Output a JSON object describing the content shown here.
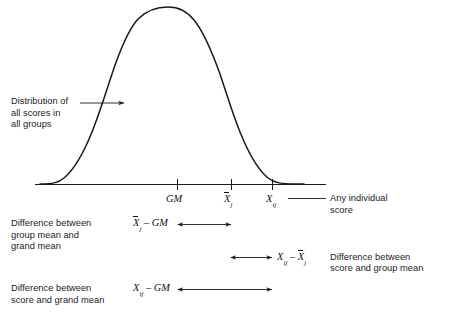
{
  "figure": {
    "type": "annotated-normal-distribution-diagram",
    "title_visible": false,
    "background_color": "#ffffff",
    "line_color": "#1a1a1a",
    "text_color": "#1c1c1c"
  },
  "curve": {
    "name": "normal-distribution-curve",
    "peak_x": 176,
    "peak_y": 12,
    "baseline_y": 184,
    "left_tail_x": 50,
    "right_tail_x": 300
  },
  "axis": {
    "name": "baseline-axis",
    "x_start": 35,
    "x_end": 326,
    "y": 184,
    "ticks": [
      {
        "label": "GM",
        "x": 177,
        "type": "plain"
      },
      {
        "label": "X̄j",
        "x": 231,
        "type": "overbar-sub"
      },
      {
        "label": "Xij",
        "x": 272,
        "type": "sub-only"
      }
    ]
  },
  "tick_labels": {
    "grand_mean": "GM",
    "group_mean_base": "X",
    "group_mean_sub": "j",
    "score_base": "X",
    "score_sub": "ij"
  },
  "callouts": {
    "distribution": {
      "lines": [
        "Distribution of",
        "all scores in",
        "all groups"
      ],
      "arrow_from_x": 80,
      "arrow_to_x": 126,
      "arrow_y": 103
    },
    "individual_score": {
      "lines": [
        "Any individual",
        "score"
      ],
      "leader_from_x": 288,
      "leader_to_x": 326,
      "leader_y": 198
    }
  },
  "differences": [
    {
      "id": "group-mean-minus-grand-mean",
      "description_lines": [
        "Difference between",
        "group mean and",
        "grand mean"
      ],
      "expression": {
        "left_base": "X",
        "left_sub": "j",
        "left_overbar": true,
        "operator": "–",
        "right": "GM"
      },
      "arrow_start_x": 178,
      "arrow_end_x": 231,
      "arrow_y": 224
    },
    {
      "id": "score-minus-group-mean",
      "description_lines": [
        "Difference between",
        "score and group mean"
      ],
      "expression": {
        "left_base": "X",
        "left_sub": "ij",
        "left_overbar": false,
        "operator": "–",
        "right_base": "X",
        "right_sub": "j",
        "right_overbar": true
      },
      "arrow_start_x": 231,
      "arrow_end_x": 272,
      "arrow_y": 257
    },
    {
      "id": "score-minus-grand-mean",
      "description_lines": [
        "Difference between",
        "score and grand mean"
      ],
      "expression": {
        "left_base": "X",
        "left_sub": "ij",
        "left_overbar": false,
        "operator": "–",
        "right": "GM"
      },
      "arrow_start_x": 178,
      "arrow_end_x": 272,
      "arrow_y": 289
    }
  ],
  "text": {
    "distribution_line1": "Distribution of",
    "distribution_line2": "all scores in",
    "distribution_line3": "all groups",
    "individual_line1": "Any individual",
    "individual_line2": "score",
    "diff1_line1": "Difference between",
    "diff1_line2": "group mean and",
    "diff1_line3": "grand mean",
    "diff2_line1": "Difference between",
    "diff2_line2": "score and group mean",
    "diff3_line1": "Difference between",
    "diff3_line2": "score and grand mean",
    "gm": "GM",
    "x": "X",
    "sub_j": "j",
    "sub_ij": "ij",
    "minus": "–"
  }
}
